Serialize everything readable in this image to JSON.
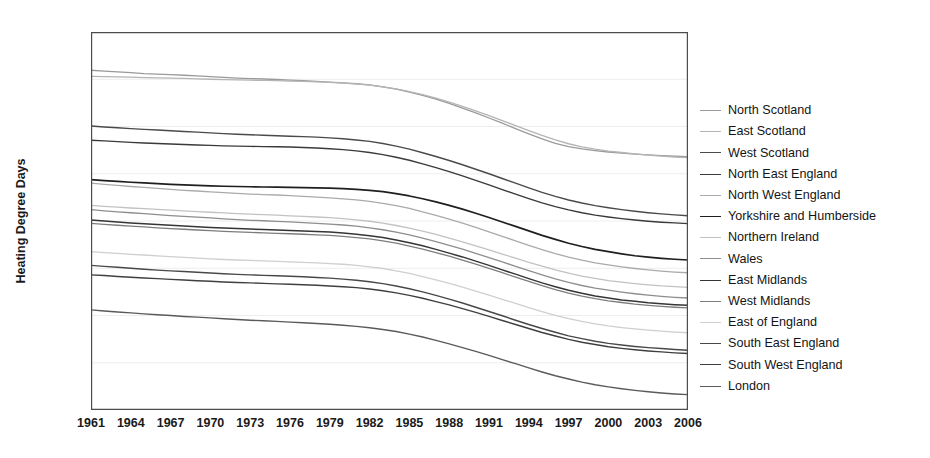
{
  "chart_data": {
    "type": "line",
    "title": "",
    "xlabel": "",
    "ylabel": "Heating Degree Days",
    "xlim": [
      1961,
      2006
    ],
    "ylim": [
      1800,
      3400
    ],
    "yticks": [
      1800,
      2000,
      2200,
      2400,
      2600,
      2800,
      3000,
      3200,
      3400
    ],
    "xticks": [
      1961,
      1964,
      1967,
      1970,
      1973,
      1976,
      1979,
      1982,
      1985,
      1988,
      1991,
      1994,
      1997,
      2000,
      2003,
      2006
    ],
    "grid": true,
    "legend_position": "right",
    "x": [
      1961,
      1962,
      1963,
      1964,
      1965,
      1966,
      1967,
      1968,
      1969,
      1970,
      1971,
      1972,
      1973,
      1974,
      1975,
      1976,
      1977,
      1978,
      1979,
      1980,
      1981,
      1982,
      1983,
      1984,
      1985,
      1986,
      1987,
      1988,
      1989,
      1990,
      1991,
      1992,
      1993,
      1994,
      1995,
      1996,
      1997,
      1998,
      1999,
      2000,
      2001,
      2002,
      2003,
      2004,
      2005,
      2006
    ],
    "series": [
      {
        "name": "North Scotland",
        "color": "#9a9a9a",
        "width": 1.3,
        "values": [
          3238,
          3234,
          3231,
          3228,
          3224,
          3222,
          3220,
          3217,
          3214,
          3211,
          3208,
          3205,
          3203,
          3201,
          3199,
          3196,
          3194,
          3191,
          3188,
          3185,
          3181,
          3176,
          3168,
          3158,
          3146,
          3132,
          3116,
          3098,
          3078,
          3058,
          3036,
          3014,
          2991,
          2969,
          2948,
          2929,
          2915,
          2905,
          2898,
          2892,
          2887,
          2883,
          2880,
          2877,
          2874,
          2872
        ]
      },
      {
        "name": "East Scotland",
        "color": "#b4b4b4",
        "width": 1.3,
        "values": [
          3212,
          3211,
          3210,
          3209,
          3207,
          3206,
          3205,
          3204,
          3202,
          3200,
          3198,
          3197,
          3196,
          3195,
          3194,
          3192,
          3191,
          3189,
          3187,
          3184,
          3180,
          3175,
          3168,
          3159,
          3148,
          3135,
          3120,
          3103,
          3085,
          3066,
          3046,
          3025,
          3004,
          2983,
          2962,
          2943,
          2927,
          2914,
          2904,
          2896,
          2890,
          2884,
          2879,
          2875,
          2871,
          2868
        ]
      },
      {
        "name": "West Scotland",
        "color": "#4a4a4a",
        "width": 1.4,
        "values": [
          3002,
          2998,
          2995,
          2991,
          2988,
          2985,
          2982,
          2979,
          2976,
          2973,
          2970,
          2967,
          2965,
          2963,
          2961,
          2959,
          2957,
          2955,
          2952,
          2948,
          2943,
          2937,
          2928,
          2917,
          2904,
          2889,
          2873,
          2856,
          2838,
          2819,
          2800,
          2780,
          2760,
          2740,
          2721,
          2704,
          2689,
          2676,
          2665,
          2656,
          2648,
          2641,
          2635,
          2630,
          2626,
          2622
        ]
      },
      {
        "name": "North East England",
        "color": "#3a3a3a",
        "width": 1.4,
        "values": [
          2942,
          2939,
          2936,
          2933,
          2930,
          2928,
          2926,
          2924,
          2922,
          2920,
          2918,
          2917,
          2916,
          2915,
          2914,
          2913,
          2911,
          2909,
          2906,
          2902,
          2897,
          2890,
          2881,
          2870,
          2857,
          2842,
          2826,
          2809,
          2791,
          2772,
          2753,
          2733,
          2714,
          2695,
          2677,
          2661,
          2647,
          2635,
          2625,
          2617,
          2610,
          2604,
          2599,
          2595,
          2592,
          2589
        ]
      },
      {
        "name": "North West England",
        "color": "#aaaaaa",
        "width": 1.3,
        "values": [
          2760,
          2755,
          2751,
          2746,
          2742,
          2738,
          2734,
          2730,
          2727,
          2723,
          2720,
          2717,
          2714,
          2712,
          2710,
          2707,
          2704,
          2701,
          2698,
          2694,
          2689,
          2683,
          2675,
          2665,
          2653,
          2639,
          2624,
          2608,
          2591,
          2573,
          2554,
          2535,
          2516,
          2497,
          2479,
          2462,
          2447,
          2434,
          2423,
          2414,
          2406,
          2399,
          2393,
          2388,
          2384,
          2381
        ]
      },
      {
        "name": "Yorkshire and Humberside",
        "color": "#1f1f1f",
        "width": 1.7,
        "values": [
          2775,
          2771,
          2768,
          2764,
          2761,
          2758,
          2755,
          2753,
          2751,
          2749,
          2747,
          2746,
          2745,
          2744,
          2743,
          2742,
          2741,
          2740,
          2739,
          2737,
          2734,
          2730,
          2724,
          2716,
          2706,
          2694,
          2681,
          2666,
          2650,
          2633,
          2615,
          2596,
          2577,
          2558,
          2539,
          2522,
          2506,
          2492,
          2480,
          2470,
          2461,
          2453,
          2447,
          2442,
          2438,
          2435
        ]
      },
      {
        "name": "Northern Ireland",
        "color": "#c2c2c2",
        "width": 1.3,
        "values": [
          2666,
          2662,
          2659,
          2655,
          2652,
          2649,
          2646,
          2643,
          2640,
          2637,
          2634,
          2631,
          2629,
          2627,
          2625,
          2622,
          2620,
          2617,
          2614,
          2610,
          2605,
          2599,
          2591,
          2581,
          2570,
          2557,
          2543,
          2528,
          2512,
          2495,
          2478,
          2460,
          2443,
          2425,
          2409,
          2393,
          2379,
          2367,
          2357,
          2348,
          2341,
          2335,
          2330,
          2325,
          2322,
          2319
        ]
      },
      {
        "name": "Wales",
        "color": "#8e8e8e",
        "width": 1.3,
        "values": [
          2648,
          2643,
          2639,
          2635,
          2631,
          2627,
          2623,
          2620,
          2616,
          2613,
          2609,
          2606,
          2603,
          2601,
          2598,
          2596,
          2593,
          2590,
          2587,
          2583,
          2578,
          2571,
          2563,
          2553,
          2541,
          2528,
          2513,
          2497,
          2481,
          2463,
          2445,
          2427,
          2408,
          2390,
          2372,
          2355,
          2340,
          2327,
          2316,
          2307,
          2299,
          2292,
          2286,
          2281,
          2277,
          2274
        ]
      },
      {
        "name": "East Midlands",
        "color": "#353535",
        "width": 1.5,
        "values": [
          2604,
          2600,
          2596,
          2592,
          2588,
          2585,
          2582,
          2579,
          2576,
          2573,
          2570,
          2568,
          2566,
          2564,
          2562,
          2560,
          2558,
          2556,
          2553,
          2549,
          2544,
          2538,
          2530,
          2520,
          2508,
          2495,
          2480,
          2464,
          2448,
          2430,
          2412,
          2393,
          2375,
          2356,
          2338,
          2322,
          2307,
          2294,
          2283,
          2274,
          2266,
          2260,
          2254,
          2250,
          2246,
          2243
        ]
      },
      {
        "name": "West Midlands",
        "color": "#7d7d7d",
        "width": 1.3,
        "values": [
          2590,
          2586,
          2582,
          2578,
          2575,
          2571,
          2568,
          2565,
          2562,
          2559,
          2556,
          2554,
          2552,
          2550,
          2548,
          2546,
          2544,
          2541,
          2539,
          2535,
          2530,
          2524,
          2516,
          2506,
          2494,
          2481,
          2466,
          2451,
          2434,
          2417,
          2399,
          2381,
          2362,
          2344,
          2326,
          2310,
          2295,
          2282,
          2271,
          2262,
          2255,
          2248,
          2243,
          2239,
          2235,
          2232
        ]
      },
      {
        "name": "East of England",
        "color": "#cfcfcf",
        "width": 1.3,
        "values": [
          2470,
          2466,
          2463,
          2459,
          2456,
          2452,
          2449,
          2446,
          2443,
          2440,
          2437,
          2435,
          2433,
          2431,
          2429,
          2427,
          2425,
          2423,
          2420,
          2417,
          2412,
          2406,
          2399,
          2389,
          2378,
          2365,
          2351,
          2336,
          2320,
          2303,
          2286,
          2268,
          2251,
          2233,
          2216,
          2201,
          2187,
          2175,
          2165,
          2156,
          2149,
          2143,
          2138,
          2134,
          2130,
          2127
        ]
      },
      {
        "name": "South East England",
        "color": "#484848",
        "width": 1.4,
        "values": [
          2412,
          2408,
          2404,
          2400,
          2396,
          2392,
          2389,
          2386,
          2383,
          2380,
          2377,
          2374,
          2372,
          2370,
          2368,
          2366,
          2364,
          2361,
          2358,
          2354,
          2349,
          2343,
          2335,
          2325,
          2313,
          2300,
          2285,
          2269,
          2253,
          2235,
          2217,
          2199,
          2180,
          2162,
          2145,
          2129,
          2114,
          2102,
          2091,
          2082,
          2075,
          2069,
          2064,
          2060,
          2056,
          2053
        ]
      },
      {
        "name": "South West England",
        "color": "#3f3f3f",
        "width": 1.4,
        "values": [
          2372,
          2369,
          2365,
          2362,
          2359,
          2356,
          2353,
          2350,
          2347,
          2345,
          2342,
          2340,
          2338,
          2336,
          2334,
          2332,
          2330,
          2328,
          2325,
          2322,
          2318,
          2312,
          2305,
          2296,
          2285,
          2273,
          2259,
          2245,
          2229,
          2213,
          2196,
          2179,
          2162,
          2145,
          2128,
          2113,
          2099,
          2087,
          2077,
          2068,
          2061,
          2055,
          2050,
          2046,
          2042,
          2039
        ]
      },
      {
        "name": "London",
        "color": "#5a5a5a",
        "width": 1.4,
        "values": [
          2224,
          2219,
          2215,
          2211,
          2207,
          2203,
          2200,
          2196,
          2193,
          2190,
          2186,
          2183,
          2180,
          2178,
          2175,
          2172,
          2169,
          2166,
          2163,
          2159,
          2154,
          2148,
          2141,
          2132,
          2121,
          2109,
          2095,
          2080,
          2064,
          2048,
          2031,
          2013,
          1996,
          1978,
          1961,
          1945,
          1931,
          1918,
          1907,
          1898,
          1890,
          1883,
          1877,
          1872,
          1868,
          1865
        ]
      }
    ]
  },
  "axis": {
    "ylabel": "Heating Degree Days"
  },
  "legend": {
    "items": [
      {
        "label": "North Scotland"
      },
      {
        "label": "East Scotland"
      },
      {
        "label": "West Scotland"
      },
      {
        "label": "North East England"
      },
      {
        "label": "North West England"
      },
      {
        "label": "Yorkshire and Humberside"
      },
      {
        "label": "Northern Ireland"
      },
      {
        "label": "Wales"
      },
      {
        "label": "East Midlands"
      },
      {
        "label": "West Midlands"
      },
      {
        "label": "East of England"
      },
      {
        "label": "South East England"
      },
      {
        "label": "South West England"
      },
      {
        "label": "London"
      }
    ]
  },
  "style": {
    "axis_color": "#4d4d4d",
    "grid_color": "#f0ecec",
    "text_color": "#1a1a1a",
    "background": "#ffffff"
  }
}
